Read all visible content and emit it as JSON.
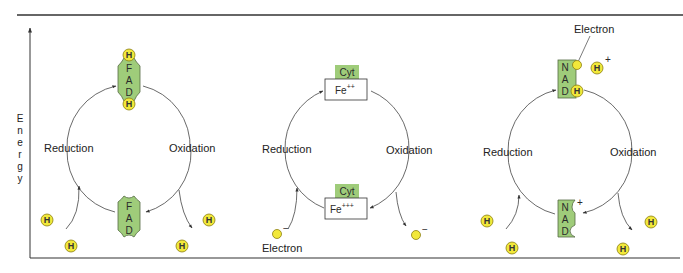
{
  "figure": {
    "axis_label": "Energy",
    "axis_letters": [
      "E",
      "n",
      "e",
      "r",
      "g",
      "y"
    ],
    "colors": {
      "molecule_green": "#9fcc7a",
      "molecule_stroke": "#556b44",
      "particle_yellow": "#f2e83a",
      "particle_stroke": "#8a7d10",
      "line": "#333333"
    },
    "panels": [
      {
        "name": "FAD cycle",
        "left_label": "Reduction",
        "right_label": "Oxidation",
        "top_molecule": {
          "letters": [
            "F",
            "A",
            "D"
          ],
          "state": "reduced (FADH2)",
          "bound_particles": [
            "H",
            "H"
          ]
        },
        "bottom_molecule": {
          "letters": [
            "F",
            "A",
            "D"
          ],
          "state": "oxidized"
        },
        "incoming_particles": [
          "H",
          "H"
        ],
        "outgoing_particles": [
          "H",
          "H"
        ],
        "particle_symbol": "H"
      },
      {
        "name": "Cytochrome cycle",
        "left_label": "Reduction",
        "right_label": "Oxidation",
        "top_molecule": {
          "tag": "Cyt",
          "ion": "Fe",
          "charge": "++"
        },
        "bottom_molecule": {
          "tag": "Cyt",
          "ion": "Fe",
          "charge": "+++"
        },
        "incoming_label": "Electron",
        "electron_charge": "−"
      },
      {
        "name": "NAD cycle",
        "left_label": "Reduction",
        "right_label": "Oxidation",
        "top_molecule": {
          "letters": [
            "N",
            "A",
            "D"
          ],
          "state": "reduced (NADH)",
          "bound_particle": "H"
        },
        "bottom_molecule": {
          "letters": [
            "N",
            "A",
            "D"
          ],
          "charge": "+"
        },
        "electron_label": "Electron",
        "free_proton": {
          "symbol": "H",
          "charge": "+"
        },
        "incoming_particles": [
          "H",
          "H"
        ],
        "outgoing_particles": [
          "H",
          "H"
        ],
        "particle_symbol": "H"
      }
    ]
  }
}
